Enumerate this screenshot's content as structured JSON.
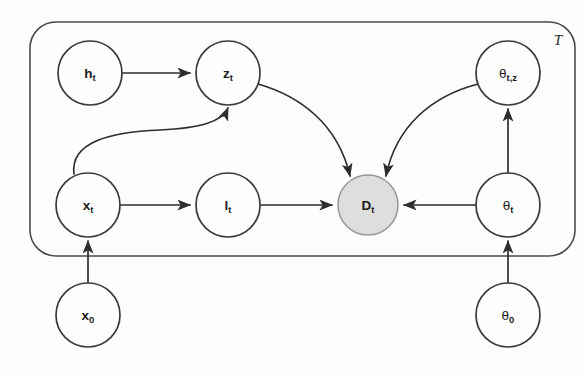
{
  "figure": {
    "type": "probabilistic-graphical-model",
    "canvas": {
      "width": 587,
      "height": 374,
      "background": "#fdfdfc"
    },
    "colors": {
      "node_fill": "#fefefe",
      "node_stroke": "#3a3a3a",
      "observed_fill": "#dedede",
      "observed_stroke": "#9a9a9a",
      "edge": "#2e2e2e",
      "plate_stroke": "#4a4a4a"
    }
  },
  "plate": {
    "label": "T",
    "x": 30,
    "y": 22,
    "width": 545,
    "height": 234,
    "radius": 26,
    "label_x": 558,
    "label_y": 40
  },
  "nodes": [
    {
      "id": "h_t",
      "base": "h",
      "sub": "t",
      "greek": false,
      "observed": false,
      "cx": 90,
      "cy": 73,
      "r": 32
    },
    {
      "id": "z_t",
      "base": "z",
      "sub": "t",
      "greek": false,
      "observed": false,
      "cx": 228,
      "cy": 73,
      "r": 32
    },
    {
      "id": "th_tz",
      "base": "θ",
      "sub": "t,z",
      "greek": true,
      "observed": false,
      "cx": 508,
      "cy": 73,
      "r": 32
    },
    {
      "id": "x_t",
      "base": "x",
      "sub": "t",
      "greek": false,
      "observed": false,
      "cx": 88,
      "cy": 205,
      "r": 32
    },
    {
      "id": "l_t",
      "base": "l",
      "sub": "t",
      "greek": false,
      "observed": false,
      "cx": 228,
      "cy": 205,
      "r": 32
    },
    {
      "id": "D_t",
      "base": "D",
      "sub": "t",
      "greek": false,
      "observed": true,
      "cx": 368,
      "cy": 205,
      "r": 30
    },
    {
      "id": "th_t",
      "base": "θ",
      "sub": "t",
      "greek": true,
      "observed": false,
      "cx": 508,
      "cy": 205,
      "r": 32
    },
    {
      "id": "x_0",
      "base": "x",
      "sub": "0",
      "greek": false,
      "observed": false,
      "cx": 88,
      "cy": 315,
      "r": 32
    },
    {
      "id": "th_0",
      "base": "θ",
      "sub": "0",
      "greek": true,
      "observed": false,
      "cx": 508,
      "cy": 315,
      "r": 32
    }
  ],
  "edges": [
    {
      "id": "h_t-to-z_t",
      "from": "h_t",
      "to": "z_t",
      "shape": "straight",
      "d": "M 122 73 L 190 73"
    },
    {
      "id": "x_t-to-l_t",
      "from": "x_t",
      "to": "l_t",
      "shape": "straight",
      "d": "M 120 205 L 190 205"
    },
    {
      "id": "l_t-to-D_t",
      "from": "l_t",
      "to": "D_t",
      "shape": "straight",
      "d": "M 260 205 L 332 205"
    },
    {
      "id": "th_t-to-D_t",
      "from": "th_t",
      "to": "D_t",
      "shape": "straight",
      "d": "M 476 205 L 404 205"
    },
    {
      "id": "th_t-to-th_tz",
      "from": "th_t",
      "to": "th_tz",
      "shape": "straight",
      "d": "M 508 173 L 508 109"
    },
    {
      "id": "x_0-to-x_t",
      "from": "x_0",
      "to": "x_t",
      "shape": "straight",
      "d": "M 88 283 L 88 241"
    },
    {
      "id": "th_0-to-th_t",
      "from": "th_0",
      "to": "th_t",
      "shape": "straight",
      "d": "M 508 283 L 508 241"
    },
    {
      "id": "x_t-to-z_t",
      "from": "x_t",
      "to": "z_t",
      "shape": "s-curve",
      "d": "M 74 174 C 70 142 110 132 160 130 C 200 128 222 122 228 108"
    },
    {
      "id": "z_t-to-D_t",
      "from": "z_t",
      "to": "D_t",
      "shape": "curve",
      "d": "M 258 84 C 300 96 338 124 350 176"
    },
    {
      "id": "th_tz-to-D_t",
      "from": "th_tz",
      "to": "D_t",
      "shape": "curve",
      "d": "M 478 84 C 432 96 396 126 386 176"
    }
  ]
}
